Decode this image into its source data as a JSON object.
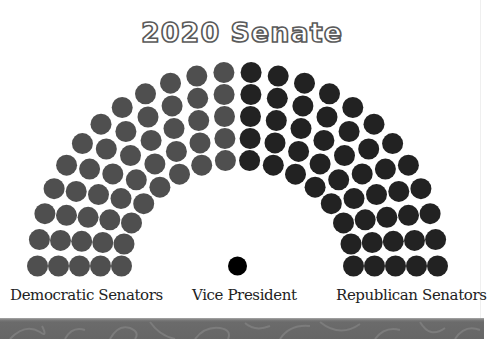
{
  "title": "2020 Senate",
  "labels": {
    "democratic": "Democratic Senators",
    "vice_president": "Vice President",
    "republican": "Republican Senators"
  },
  "colors": {
    "democratic": "#4f4f4f",
    "republican": "#222222",
    "vice_president": "#000000",
    "footer": "#6b6b6b"
  },
  "chart_data": {
    "type": "parliament",
    "title": "2020 Senate",
    "total_seats": 100,
    "series": [
      {
        "name": "Democratic Senators",
        "value": 50,
        "color": "#4f4f4f",
        "side": "left"
      },
      {
        "name": "Republican Senators",
        "value": 50,
        "color": "#222222",
        "side": "right"
      },
      {
        "name": "Vice President",
        "value": 1,
        "color": "#000000",
        "position": "center"
      }
    ],
    "rows": [
      {
        "row": 1,
        "seats": 16,
        "rx": 116,
        "ry": 106
      },
      {
        "row": 2,
        "seats": 18,
        "rx": 137,
        "ry": 128
      },
      {
        "row": 3,
        "seats": 20,
        "rx": 158,
        "ry": 150
      },
      {
        "row": 4,
        "seats": 22,
        "rx": 179,
        "ry": 172
      },
      {
        "row": 5,
        "seats": 24,
        "rx": 200,
        "ry": 194
      }
    ],
    "layout": {
      "center_x": 237.5,
      "center_y": 266,
      "seat_radius": 10.5,
      "vp_radius": 9.5
    },
    "legend": [
      "Democratic Senators",
      "Vice President",
      "Republican Senators"
    ]
  }
}
